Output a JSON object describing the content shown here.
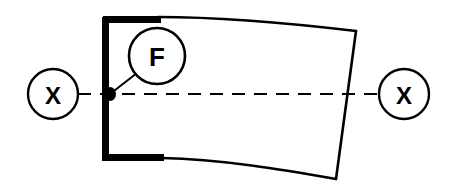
{
  "diagram": {
    "background_color": "#ffffff",
    "line_color": "#000000",
    "canvas": {
      "width": 450,
      "height": 190
    },
    "balloons": [
      {
        "id": "datum-feature-f",
        "label": "F",
        "type": "feature-callout",
        "cx": 157,
        "cy": 56,
        "r": 28,
        "font_size": 26,
        "stroke_width": 2.6
      },
      {
        "id": "section-marker-left",
        "label": "X",
        "type": "section-marker",
        "cx": 53,
        "cy": 94,
        "r": 25,
        "font_size": 24,
        "stroke_width": 2.4
      },
      {
        "id": "section-marker-right",
        "label": "X",
        "type": "section-marker",
        "cx": 404,
        "cy": 94,
        "r": 25,
        "font_size": 24,
        "stroke_width": 2.4
      }
    ],
    "leader_line": {
      "id": "f-leader",
      "from_x": 137,
      "from_y": 73,
      "to_x": 110,
      "to_y": 94,
      "stroke_width": 2.0
    },
    "origin_dot": {
      "id": "datum-origin-dot",
      "cx": 110,
      "cy": 94,
      "rx": 6,
      "ry": 7
    },
    "centerline": {
      "id": "axis-centerline",
      "y": 94,
      "x_start": 78,
      "x_end": 379,
      "stroke_width": 2.2,
      "dash_pattern": "13 9"
    },
    "profile": {
      "datum_edges": [
        {
          "id": "datum-edge-left-vertical",
          "path": "M 105.5 17 L 105.5 161",
          "stroke_width": 7
        },
        {
          "id": "datum-edge-top-left",
          "path": "M 103 19.5 L 161 19.5",
          "stroke_width": 7
        },
        {
          "id": "datum-edge-bottom-left",
          "path": "M 103 157.5 L 164 157.5",
          "stroke_width": 7
        }
      ],
      "profile_edges": [
        {
          "id": "profile-edge-top",
          "path": "M 158 17 C 215 17, 280 22, 356 31",
          "stroke_width": 2.6
        },
        {
          "id": "profile-edge-right",
          "path": "M 356 31 L 336 179",
          "stroke_width": 2.6
        },
        {
          "id": "profile-edge-bottom",
          "path": "M 162 158 C 220 159, 285 170, 336 179",
          "stroke_width": 2.6
        }
      ]
    }
  }
}
